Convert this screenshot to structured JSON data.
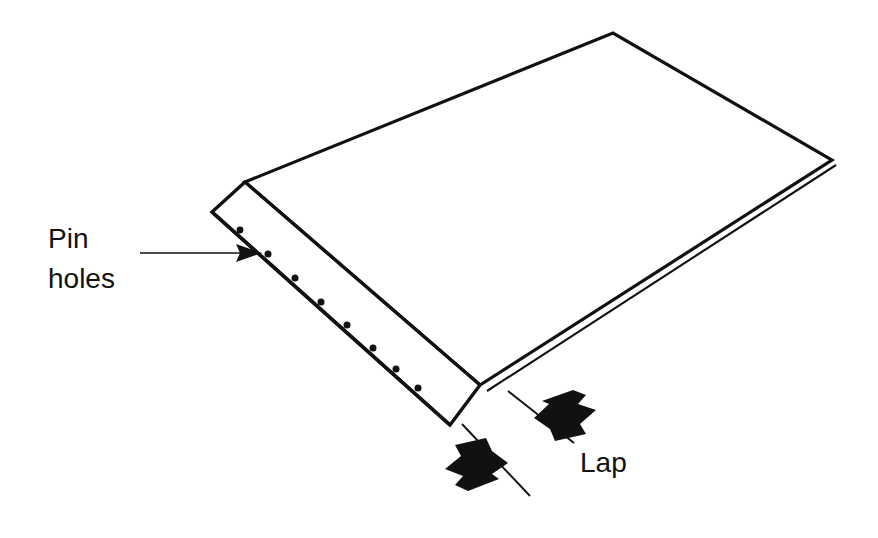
{
  "figure": {
    "type": "technical-line-diagram",
    "background_color": "#ffffff",
    "line_color": "#111111",
    "fill_color": "#ffffff",
    "width": 878,
    "height": 538
  },
  "labels": {
    "pin_holes": {
      "line1": "Pin",
      "line2": "holes",
      "full": "Pin holes",
      "x": 48,
      "y": 248,
      "font_size": 27,
      "color": "#111111"
    },
    "lap": {
      "text": "Lap",
      "x": 580,
      "y": 470,
      "font_size": 27,
      "color": "#111111"
    }
  },
  "leaders": {
    "pin_holes_leader": {
      "from_x": 140,
      "from_y": 253,
      "to_x": 262,
      "to_y": 253,
      "arrowhead": "solid-triangle",
      "stroke_width": 1.6
    },
    "lap_leader_upper": {
      "from_x": 572,
      "from_y": 441,
      "to_x": 508,
      "to_y": 391,
      "stroke_width": 1.8
    },
    "lap_leader_lower": {
      "from_x": 528,
      "from_y": 494,
      "to_x": 462,
      "to_y": 424,
      "stroke_width": 1.8
    }
  },
  "callout_arrows": {
    "upper_arrow": {
      "direction": "down-left",
      "tip_x": 534,
      "tip_y": 418,
      "fill": "#111111"
    },
    "lower_arrow": {
      "direction": "up-right",
      "tip_x": 508,
      "tip_y": 463,
      "fill": "#111111"
    }
  },
  "geometry": {
    "top_sheet_outline": "245,182 613,33 832,160 480,385",
    "second_sheet_edge": "490,392 836,165",
    "pin_strip_outer": "212,212 245,182 480,385 450,425",
    "pin_strip_inner_line": "245,195 468,378"
  },
  "pin_holes": {
    "count": 9,
    "radius": 3.4,
    "color": "#111111",
    "points": [
      {
        "x": 239,
        "y": 229
      },
      {
        "x": 265,
        "y": 253
      },
      {
        "x": 291,
        "y": 277
      },
      {
        "x": 317,
        "y": 301
      },
      {
        "x": 343,
        "y": 325
      },
      {
        "x": 369,
        "y": 349
      },
      {
        "x": 392,
        "y": 370
      },
      {
        "x": 413,
        "y": 387
      },
      {
        "x": 268,
        "y": 254
      }
    ]
  }
}
